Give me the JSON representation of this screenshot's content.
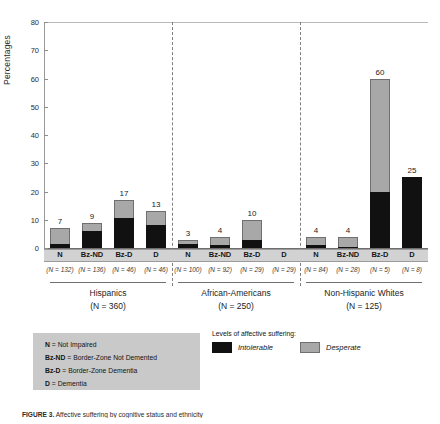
{
  "chart_data": {
    "type": "bar",
    "title": "",
    "subtype": "stacked-grouped",
    "ylabel": "Percentages",
    "xlabel": "",
    "ylim": [
      0,
      80
    ],
    "yticks": [
      0,
      10,
      20,
      30,
      40,
      50,
      60,
      70,
      80
    ],
    "grid": false,
    "legend_position": "below-right",
    "stack_order": [
      "Intolerable",
      "Desperate"
    ],
    "series": [
      {
        "name": "Intolerable",
        "color": "#111111"
      },
      {
        "name": "Desperate",
        "color": "#a8a8a8"
      }
    ],
    "categories": [
      "N",
      "Bz-ND",
      "Bz-D",
      "D"
    ],
    "groups": [
      {
        "name": "Hispanics",
        "n_label": "(N = 360)",
        "bars": [
          {
            "category": "N",
            "n_label": "(N = 132)",
            "total": 7,
            "total_label": "7",
            "intolerable": 1.5,
            "desperate": 5.5
          },
          {
            "category": "Bz-ND",
            "n_label": "(N = 136)",
            "total": 9,
            "total_label": "9",
            "intolerable": 6.0,
            "desperate": 3.0
          },
          {
            "category": "Bz-D",
            "n_label": "(N = 46)",
            "total": 17,
            "total_label": "17",
            "intolerable": 10.5,
            "desperate": 6.5
          },
          {
            "category": "D",
            "n_label": "(N = 46)",
            "total": 13,
            "total_label": "13",
            "intolerable": 8.0,
            "desperate": 5.0
          }
        ]
      },
      {
        "name": "African-Americans",
        "n_label": "(N = 250)",
        "bars": [
          {
            "category": "N",
            "n_label": "(N = 100)",
            "total": 3,
            "total_label": "3",
            "intolerable": 1.5,
            "desperate": 1.5
          },
          {
            "category": "Bz-ND",
            "n_label": "(N = 92)",
            "total": 4,
            "total_label": "4",
            "intolerable": 1.0,
            "desperate": 3.0
          },
          {
            "category": "Bz-D",
            "n_label": "(N = 29)",
            "total": 10,
            "total_label": "10",
            "intolerable": 3.0,
            "desperate": 7.0
          },
          {
            "category": "D",
            "n_label": "(N = 29)",
            "total": 0,
            "total_label": "",
            "intolerable": 0,
            "desperate": 0
          }
        ]
      },
      {
        "name": "Non-Hispanic Whites",
        "n_label": "(N = 125)",
        "bars": [
          {
            "category": "N",
            "n_label": "(N = 84)",
            "total": 4,
            "total_label": "4",
            "intolerable": 1.0,
            "desperate": 3.0
          },
          {
            "category": "Bz-ND",
            "n_label": "(N = 28)",
            "total": 4,
            "total_label": "4",
            "intolerable": 0.5,
            "desperate": 3.5
          },
          {
            "category": "Bz-D",
            "n_label": "(N = 5)",
            "total": 60,
            "total_label": "60",
            "intolerable": 20.0,
            "desperate": 40.0
          },
          {
            "category": "D",
            "n_label": "(N = 8)",
            "total": 25,
            "total_label": "25",
            "intolerable": 25.0,
            "desperate": 0
          }
        ]
      }
    ]
  },
  "abbreviation_key": {
    "lines": [
      {
        "abbr": "N",
        "definition": " = Not Impaired"
      },
      {
        "abbr": "Bz-ND",
        "definition": " = Border-Zone Not Demented"
      },
      {
        "abbr": "Bz-D",
        "definition": " = Border-Zone Dementia"
      },
      {
        "abbr": "D",
        "definition": " = Dementia"
      }
    ]
  },
  "legend": {
    "title": "Levels of affective suffering:",
    "items": [
      {
        "label": "Intolerable",
        "swatch": "black-swatch-icon",
        "color": "#111111"
      },
      {
        "label": "Desperate",
        "swatch": "gray-swatch-icon",
        "color": "#a8a8a8"
      }
    ]
  },
  "caption": {
    "figure_number": "FIGURE 3.",
    "text": "Affective suffering by cognitive status and ethnicity"
  }
}
